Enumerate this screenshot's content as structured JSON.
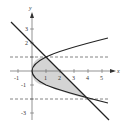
{
  "diagram": {
    "type": "region-between-curves",
    "curves": [
      {
        "name": "parabola",
        "equation": "x = y^2"
      },
      {
        "name": "line",
        "equation": "x = 2 - y"
      }
    ],
    "intersections": [
      [
        1,
        1
      ],
      [
        4,
        -2
      ]
    ],
    "guides": [
      {
        "y": 1,
        "style": "dashed"
      },
      {
        "y": -2,
        "style": "dashed"
      }
    ],
    "shaded_region": "between x = y^2 and x = 2 - y for -2 <= y <= 1",
    "colors": {
      "shade": "#d4d4d4",
      "curve": "#222222",
      "axis": "#555555",
      "dash": "#666666"
    }
  },
  "axes": {
    "x_label": "x",
    "y_label": "y",
    "x_ticks": [
      "-1",
      "1",
      "2",
      "3",
      "4",
      "5"
    ],
    "y_ticks": [
      "3",
      "2",
      "-1",
      "-3"
    ]
  }
}
